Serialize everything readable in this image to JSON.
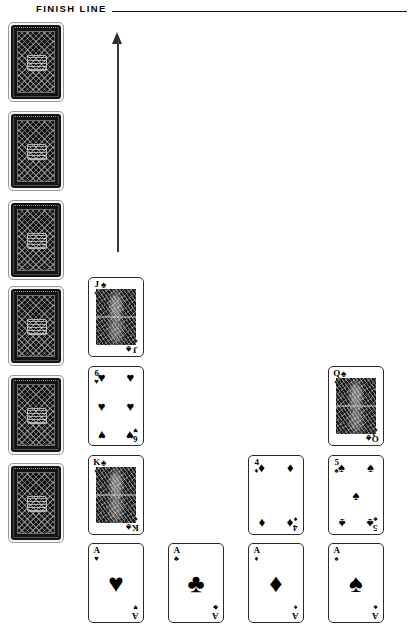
{
  "header": {
    "finish_line_label": "FINISH LINE"
  },
  "direction_arrow": {
    "name": "movement-direction-arrow",
    "direction": "up"
  },
  "colors": {
    "ink": "#000000",
    "card_back": "#141414",
    "background": "#ffffff",
    "rule": "#111111"
  },
  "suits": {
    "spade": "♠",
    "heart": "♥",
    "diamond": "♦",
    "club": "♣"
  },
  "deck_pile": {
    "label": "face-down-deck-column",
    "count": 6,
    "cards": [
      {
        "face_down": true,
        "position": 1
      },
      {
        "face_down": true,
        "position": 2
      },
      {
        "face_down": true,
        "position": 3
      },
      {
        "face_down": true,
        "position": 4
      },
      {
        "face_down": true,
        "position": 5
      },
      {
        "face_down": true,
        "position": 6
      }
    ]
  },
  "lanes": [
    {
      "lane_index": 1,
      "base_card": {
        "rank": "A",
        "suit": "heart",
        "suit_glyph": "♥",
        "label": "Ace of Hearts"
      },
      "progress_cards": [
        {
          "rank": "J",
          "suit": "spade",
          "suit_glyph": "♠",
          "label": "Jack of Spades",
          "court": true
        },
        {
          "rank": "6",
          "suit": "heart",
          "suit_glyph": "♥",
          "label": "6 of Hearts",
          "court": false
        },
        {
          "rank": "K",
          "suit": "spade",
          "suit_glyph": "♠",
          "label": "King of Spades",
          "court": true
        }
      ],
      "progress_count": 3
    },
    {
      "lane_index": 2,
      "base_card": {
        "rank": "A",
        "suit": "club",
        "suit_glyph": "♣",
        "label": "Ace of Clubs"
      },
      "progress_cards": [],
      "progress_count": 0
    },
    {
      "lane_index": 3,
      "base_card": {
        "rank": "A",
        "suit": "diamond",
        "suit_glyph": "♦",
        "label": "Ace of Diamonds"
      },
      "progress_cards": [
        {
          "rank": "4",
          "suit": "diamond",
          "suit_glyph": "♦",
          "label": "4 of Diamonds",
          "court": false
        }
      ],
      "progress_count": 1
    },
    {
      "lane_index": 4,
      "base_card": {
        "rank": "A",
        "suit": "spade",
        "suit_glyph": "♠",
        "label": "Ace of Spades"
      },
      "progress_cards": [
        {
          "rank": "Q",
          "suit": "spade",
          "suit_glyph": "♠",
          "label": "Queen of Spades",
          "court": true
        },
        {
          "rank": "5",
          "suit": "spade",
          "suit_glyph": "♠",
          "label": "5 of Spades",
          "court": false
        }
      ],
      "progress_count": 2
    }
  ]
}
